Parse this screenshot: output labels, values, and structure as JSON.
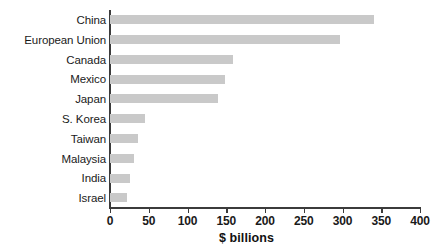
{
  "chart_data": {
    "type": "bar",
    "orientation": "horizontal",
    "title": "",
    "xlabel": "$ billions",
    "ylabel": "",
    "categories": [
      "China",
      "European Union",
      "Canada",
      "Mexico",
      "Japan",
      "S. Korea",
      "Taiwan",
      "Malaysia",
      "India",
      "Israel"
    ],
    "values": [
      340,
      297,
      159,
      148,
      139,
      45,
      36,
      31,
      26,
      22
    ],
    "xlim": [
      0,
      400
    ],
    "xticks": [
      0,
      50,
      100,
      150,
      200,
      250,
      300,
      350,
      400
    ],
    "xtick_labels": [
      "0",
      "50",
      "100",
      "150",
      "200",
      "250",
      "300",
      "350",
      "400"
    ],
    "grid": false,
    "legend": null,
    "bar_color": "#c9c9c9",
    "axis_color": "#3b3b3b",
    "text_color": "#1a1a1a"
  }
}
